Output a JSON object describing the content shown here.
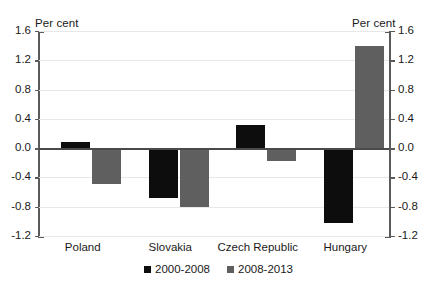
{
  "chart_data": {
    "type": "bar",
    "title": "",
    "subtitle": "",
    "xlabel": "",
    "ylabel": "Per cent",
    "ylabel_right": "Per cent",
    "ylim": [
      -1.2,
      1.6
    ],
    "yticks": [
      1.6,
      1.2,
      0.8,
      0.4,
      0.0,
      -0.4,
      -0.8,
      -1.2
    ],
    "ytick_labels": [
      "1.6",
      "1.2",
      "0.8",
      "0.4",
      "0.0",
      "-0.4",
      "-0.8",
      "-1.2"
    ],
    "ytick_labels_right": [
      "1.6",
      "1.2",
      "0.8",
      "0.4",
      "0.0",
      "-0.4",
      "-0.8",
      "-1.2"
    ],
    "grid": true,
    "legend_position": "bottom-center",
    "dual_axis": true,
    "categories": [
      "Poland",
      "Slovakia",
      "Czech Republic",
      "Hungary"
    ],
    "series": [
      {
        "name": "2000-2008",
        "color": "#0d0d0d",
        "values": [
          0.08,
          -0.68,
          0.31,
          -1.02
        ]
      },
      {
        "name": "2008-2013",
        "color": "#5f5f5f",
        "values": [
          -0.49,
          -0.8,
          -0.18,
          1.4
        ]
      }
    ]
  },
  "legend": {
    "entries": [
      {
        "label": "2000-2008",
        "color": "#0d0d0d"
      },
      {
        "label": "2008-2013",
        "color": "#5f5f5f"
      }
    ]
  },
  "colors": {
    "series_a": "#0d0d0d",
    "series_b": "#5f5f5f",
    "axis": "#5a5a5a",
    "grid": "#e8e8e8",
    "zero_line": "#4a4a4a",
    "text": "#1a1a1a",
    "background": "#ffffff"
  }
}
